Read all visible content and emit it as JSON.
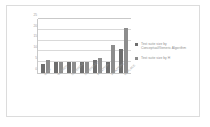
{
  "chart_data": {
    "type": "bar",
    "title": "",
    "xlabel": "",
    "ylabel": "",
    "ylim": [
      0,
      25
    ],
    "yticks": [
      "0",
      "5",
      "10",
      "15",
      "20",
      "25"
    ],
    "grid": true,
    "legend_position": "right",
    "categories": [
      "MUAT",
      "CONRED",
      "SCHEDULE",
      "SCHEDULE2",
      "PRINTTOK",
      "PRINTTOK2",
      "REPLACE"
    ],
    "series": [
      {
        "name": "Test suite size by Conceptual/Generic Algorithm",
        "color": "#6e6e6e",
        "values": [
          4,
          5,
          5,
          5,
          6,
          5,
          11
        ]
      },
      {
        "name": "Test suite size by H",
        "color": "#8d8d8d",
        "values": [
          6,
          5,
          5,
          5,
          7,
          13,
          21
        ]
      }
    ]
  },
  "legend": {
    "entries": [
      {
        "label": "Test suite size by Conceptual/Generic Algorithm",
        "swatch": "legend-swatch-series-0"
      },
      {
        "label": "Test suite size by H",
        "swatch": "legend-swatch-series-1"
      }
    ]
  },
  "colors": {
    "series_0": "#6e6e6e",
    "series_1": "#8d8d8d",
    "gridline": "#d9d9d9",
    "axis": "#c9c9c9",
    "frame_border": "#dcdcdc",
    "tick_text": "#9a9a9a",
    "legend_text": "#8f8f8f",
    "background": "#ffffff"
  }
}
